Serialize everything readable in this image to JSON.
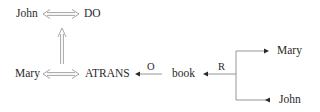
{
  "diagram": {
    "type": "conceptual-dependency",
    "colors": {
      "text": "#2a2a2a",
      "line": "#8a8a8a",
      "arrow_head": "#2a2a2a",
      "double_arrow": "#a0a0a0"
    },
    "top_row": {
      "actor": "John",
      "primitive": "DO"
    },
    "bottom_row": {
      "actor": "Mary",
      "primitive": "ATRANS",
      "object_label": "O",
      "object": "book",
      "recipient_label": "R",
      "recipient_to": "Mary",
      "recipient_from": "John"
    },
    "links": [
      {
        "from": "John",
        "to": "DO",
        "type": "two-way"
      },
      {
        "from": "Mary",
        "to": "ATRANS",
        "type": "two-way"
      },
      {
        "from": "ATRANS",
        "to": "DO",
        "type": "causal-up"
      },
      {
        "from": "book",
        "to": "ATRANS",
        "label": "O"
      },
      {
        "from": "recipient",
        "to": "book",
        "label": "R"
      }
    ]
  }
}
